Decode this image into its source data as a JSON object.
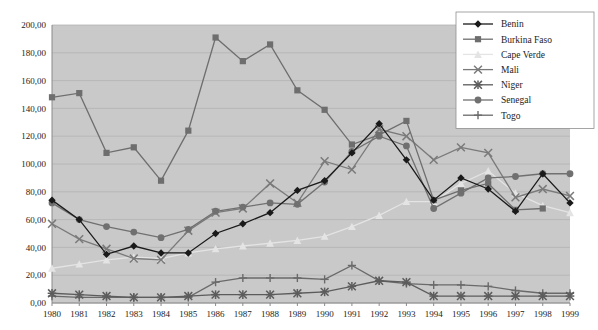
{
  "chart_data": {
    "type": "line",
    "title": "",
    "subtitle": "",
    "xlabel": "",
    "ylabel": "",
    "grid": true,
    "legend_position": "top-right",
    "xlim": [
      1980,
      1999
    ],
    "ylim": [
      0,
      200
    ],
    "ytick_step": 20,
    "ytick_labels": [
      "0,00",
      "20,00",
      "40,00",
      "60,00",
      "80,00",
      "100,00",
      "120,00",
      "140,00",
      "160,00",
      "180,00",
      "200,00"
    ],
    "ytick_values": [
      0,
      20,
      40,
      60,
      80,
      100,
      120,
      140,
      160,
      180,
      200
    ],
    "categories": [
      1980,
      1981,
      1982,
      1983,
      1984,
      1985,
      1986,
      1987,
      1988,
      1989,
      1990,
      1991,
      1992,
      1993,
      1994,
      1995,
      1996,
      1997,
      1998,
      1999
    ],
    "xtick_labels": [
      "1980",
      "1981",
      "1982",
      "1983",
      "1984",
      "1985",
      "1986",
      "1987",
      "1988",
      "1989",
      "1990",
      "1991",
      "1992",
      "1993",
      "1994",
      "1995",
      "1996",
      "1997",
      "1998",
      "1999"
    ],
    "series": [
      {
        "name": "Benin",
        "marker": "diamond",
        "color": "#1a1a1a",
        "values": [
          74,
          60,
          35,
          41,
          36,
          36,
          50,
          57,
          65,
          81,
          88,
          108,
          129,
          103,
          74,
          90,
          82,
          66,
          93,
          72
        ]
      },
      {
        "name": "Burkina Faso",
        "marker": "square",
        "color": "#6e6e6e",
        "values": [
          148,
          151,
          108,
          112,
          88,
          124,
          191,
          174,
          186,
          153,
          139,
          114,
          121,
          131,
          74,
          81,
          86,
          67,
          68,
          null
        ]
      },
      {
        "name": "Cape Verde",
        "marker": "triangle",
        "color": "#e4e4e4",
        "values": [
          25,
          28,
          31,
          33,
          32,
          36,
          39,
          41,
          43,
          45,
          48,
          55,
          63,
          73,
          73,
          86,
          95,
          79,
          70,
          65
        ]
      },
      {
        "name": "Mali",
        "marker": "cross",
        "color": "#7a7a7a",
        "values": [
          57,
          46,
          39,
          32,
          31,
          52,
          65,
          68,
          86,
          72,
          102,
          96,
          125,
          120,
          103,
          112,
          108,
          76,
          82,
          77
        ]
      },
      {
        "name": "Niger",
        "marker": "star",
        "color": "#5c5c5c",
        "values": [
          7,
          6,
          5,
          4,
          4,
          5,
          6,
          6,
          6,
          7,
          8,
          12,
          16,
          15,
          5,
          5,
          5,
          5,
          5,
          5
        ]
      },
      {
        "name": "Senegal",
        "marker": "circle",
        "color": "#707070",
        "values": [
          72,
          60,
          55,
          51,
          47,
          53,
          66,
          69,
          72,
          71,
          87,
          109,
          120,
          113,
          68,
          79,
          90,
          91,
          93,
          93
        ]
      },
      {
        "name": "Togo",
        "marker": "plus",
        "color": "#6a6a6a",
        "values": [
          5,
          4,
          4,
          4,
          4,
          4,
          15,
          18,
          18,
          18,
          17,
          27,
          16,
          14,
          13,
          13,
          12,
          9,
          7,
          7
        ]
      }
    ]
  },
  "legend": {
    "items": [
      {
        "label": "Benin",
        "marker": "diamond"
      },
      {
        "label": "Burkina Faso",
        "marker": "square"
      },
      {
        "label": "Cape Verde",
        "marker": "triangle"
      },
      {
        "label": "Mali",
        "marker": "cross"
      },
      {
        "label": "Niger",
        "marker": "star"
      },
      {
        "label": "Senegal",
        "marker": "circle"
      },
      {
        "label": "Togo",
        "marker": "plus"
      }
    ]
  }
}
